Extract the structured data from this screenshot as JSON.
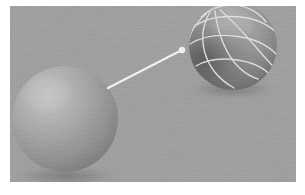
{
  "figure": {
    "caption": "",
    "width_px": 305,
    "height_px": 195,
    "background_color": "#ffffff",
    "panel": {
      "name": "render-viewport",
      "background_color": "#9b9b9b",
      "left_px": 10,
      "top_px": 6,
      "width_px": 286,
      "height_px": 176
    }
  },
  "objects": {
    "solid_sphere": {
      "label": "solid-shaded-sphere",
      "center_x": 65,
      "center_y": 119,
      "radius": 53,
      "fill_color": "#9d9d9d",
      "highlight_color": "#b9b9b9",
      "shadow_color": "#6e6e6e",
      "description": "Smooth Gouraud-shaded grey sphere with upper-left highlight and soft contact shadow"
    },
    "wireframe_sphere": {
      "label": "wireframe-mesh-sphere",
      "center_x": 233,
      "center_y": 46,
      "radius": 44,
      "fill_color": "#8f8f8f",
      "highlight_color": "#b0b0b0",
      "shadow_color": "#5d5d5d",
      "wire_color": "#e3e3e3",
      "wire_width": 1.4,
      "meridian_count": 4,
      "parallel_count": 3,
      "description": "Grey sphere overlaid with bright latitude and longitude mesh curves"
    },
    "arrow": {
      "label": "transformation-arrow",
      "color": "#f2f2f2",
      "start_x": 108,
      "start_y": 88,
      "end_x": 180,
      "end_y": 51,
      "stroke_width": 2.2,
      "head_radius": 3.2,
      "description": "White arrow pointing from the solid sphere up-right to the wireframe sphere"
    }
  }
}
